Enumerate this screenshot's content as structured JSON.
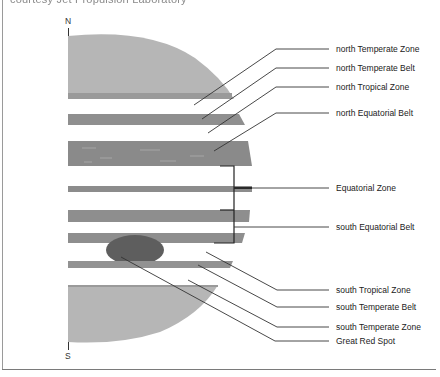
{
  "caption": {
    "text": "courtesy Jet Propulsion Laboratory",
    "note": "partially cropped at top edge"
  },
  "diagram": {
    "title_subject": "Jupiter cloud bands",
    "poles": {
      "north": "N",
      "south": "S"
    },
    "colors": {
      "polar_region": "#b4b4b4",
      "belt": "#8e8e8e",
      "great_red_spot": "#5e5e5e",
      "leader_line": "#333333",
      "background": "#ffffff"
    },
    "labels": [
      {
        "id": "north-temperate-zone",
        "text": "north Temperate Zone",
        "y": 44
      },
      {
        "id": "north-temperate-belt",
        "text": "north Temperate Belt",
        "y": 63
      },
      {
        "id": "north-tropical-zone",
        "text": "north Tropical Zone",
        "y": 82
      },
      {
        "id": "north-equatorial-belt",
        "text": "north Equatorial Belt",
        "y": 108
      },
      {
        "id": "equatorial-zone",
        "text": "Equatorial Zone",
        "y": 183
      },
      {
        "id": "south-equatorial-belt",
        "text": "south Equatorial Belt",
        "y": 222
      },
      {
        "id": "south-tropical-zone",
        "text": "south Tropical Zone",
        "y": 285
      },
      {
        "id": "south-temperate-belt",
        "text": "south Temperate Belt",
        "y": 302
      },
      {
        "id": "south-temperate-zone",
        "text": "south Temperate Zone",
        "y": 322
      },
      {
        "id": "great-red-spot",
        "text": "Great Red Spot",
        "y": 336
      }
    ]
  }
}
